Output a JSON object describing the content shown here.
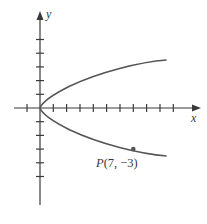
{
  "chart_data": {
    "type": "line",
    "title": "",
    "xlabel": "x",
    "ylabel": "y",
    "equation": "x = (7/9) y^2",
    "xlim": [
      -1,
      10
    ],
    "ylim": [
      -5,
      5
    ],
    "grid": false,
    "x_ticks": [
      -1,
      1,
      2,
      3,
      4,
      5,
      6,
      7,
      8,
      9,
      10
    ],
    "y_ticks": [
      -5,
      -4,
      -3,
      -2,
      -1,
      1,
      2,
      3,
      4,
      5
    ],
    "series": [
      {
        "name": "parabola",
        "points": [
          [
            9.5,
            3.5
          ],
          [
            7,
            3
          ],
          [
            3.11,
            2
          ],
          [
            0.78,
            1
          ],
          [
            0,
            0
          ],
          [
            0.78,
            -1
          ],
          [
            3.11,
            -2
          ],
          [
            7,
            -3
          ],
          [
            9.5,
            -3.5
          ]
        ]
      }
    ],
    "annotations": [
      {
        "label": "P(7, −3)",
        "x": 7,
        "y": -3
      }
    ],
    "colors": {
      "axis": "#3a3a3a",
      "curve": "#555555",
      "point": "#555555"
    }
  },
  "labels": {
    "x_axis": "x",
    "y_axis": "y",
    "point_label": "P(7, −3)"
  }
}
